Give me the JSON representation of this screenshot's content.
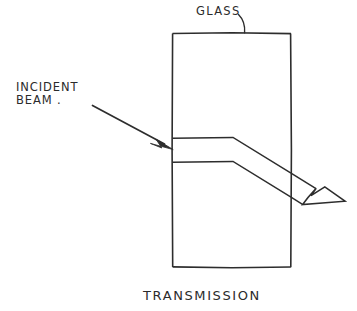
{
  "figure": {
    "title_caption": "TRANSMISSION",
    "background_color": "#ffffff",
    "ink_color": "#2d2d2d",
    "width": 357,
    "height": 311
  },
  "labels": {
    "glass": "GLASS",
    "incident_line1": "INCIDENT",
    "incident_line2": "BEAM .",
    "caption": "TRANSMISSION"
  },
  "elements": {
    "slab_name": "glass-slab",
    "incident_arrow_name": "incident-beam-arrow",
    "refracted_band_name": "refracted-beam-band",
    "exit_arrow_name": "transmitted-beam-arrow",
    "glass_leader_name": "glass-label-leader"
  },
  "geometry": {
    "slab": {
      "x": 172,
      "y": 33,
      "width": 119,
      "height": 234
    },
    "incident_beam": {
      "start_x": 92,
      "start_y": 105,
      "tip_x": 173,
      "tip_y": 149
    },
    "beam_entry_top_y": 138,
    "beam_entry_bottom_y": 162,
    "bend_x_top": 233,
    "bend_x_bottom": 233,
    "exit_top": {
      "x": 291,
      "y": 173
    },
    "exit_bottom": {
      "x": 291,
      "y": 197
    },
    "exit_arrow_tip": {
      "x": 345,
      "y": 201
    }
  }
}
